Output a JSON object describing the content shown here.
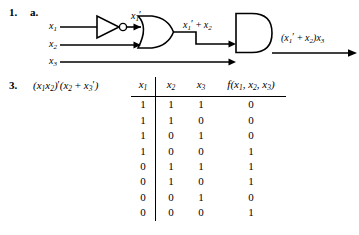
{
  "problem1": {
    "number": "1.",
    "part": "a.",
    "inputs": [
      {
        "name": "input-x1",
        "base": "x",
        "sub": "1"
      },
      {
        "name": "input-x2",
        "base": "x",
        "sub": "2"
      },
      {
        "name": "input-x3",
        "base": "x",
        "sub": "3"
      }
    ],
    "gates": [
      {
        "name": "not-gate",
        "type": "NOT"
      },
      {
        "name": "or-gate",
        "type": "OR"
      },
      {
        "name": "and-gate",
        "type": "AND"
      }
    ],
    "labels": {
      "not_output": "x′1′",
      "not_output_parts": {
        "base": "x",
        "sub": "1",
        "prime": "′"
      },
      "or_output": "x′1′ + x′2",
      "final_output": "(x′1′ + x′2)x′3"
    }
  },
  "problem3": {
    "number": "3.",
    "expression": "(x′1x′2)′(x′2 + x′3′)",
    "table": {
      "headers": [
        "x′1",
        "x′2",
        "x′3",
        "f(x′1, x′2, x′3)"
      ],
      "rows": [
        [
          "1",
          "1",
          "1",
          "0"
        ],
        [
          "1",
          "1",
          "0",
          "0"
        ],
        [
          "1",
          "0",
          "1",
          "0"
        ],
        [
          "1",
          "0",
          "0",
          "1"
        ],
        [
          "0",
          "1",
          "1",
          "1"
        ],
        [
          "0",
          "1",
          "0",
          "1"
        ],
        [
          "0",
          "0",
          "1",
          "0"
        ],
        [
          "0",
          "0",
          "0",
          "1"
        ]
      ]
    }
  },
  "colors": {
    "ink": "#000000",
    "background": "#ffffff"
  }
}
